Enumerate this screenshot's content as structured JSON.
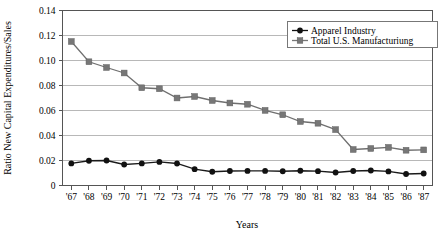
{
  "chart_data": {
    "type": "line",
    "title": "",
    "xlabel": "Years",
    "ylabel": "Ratio New Capital Expenditures/Sales",
    "x": [
      "'67",
      "'68",
      "'69",
      "'70",
      "'71",
      "'72",
      "'73",
      "'74",
      "'75",
      "'76",
      "'77",
      "'78",
      "'79",
      "'80",
      "'81",
      "'82",
      "'83",
      "'84",
      "'85",
      "'86",
      "'87"
    ],
    "categories": [
      "'67",
      "'68",
      "'69",
      "'70",
      "'71",
      "'72",
      "'73",
      "'74",
      "'75",
      "'76",
      "'77",
      "'78",
      "'79",
      "'80",
      "'81",
      "'82",
      "'83",
      "'84",
      "'85",
      "'86",
      "'87"
    ],
    "ylim": [
      0,
      0.14
    ],
    "yticks": [
      0,
      0.02,
      0.04,
      0.06,
      0.08,
      0.1,
      0.12,
      0.14
    ],
    "ytick_labels": [
      "0",
      "0.02",
      "0.04",
      "0.06",
      "0.08",
      "0.10",
      "0.12",
      "0.14"
    ],
    "grid": true,
    "legend_position": "top-right",
    "series": [
      {
        "name": "Apparel Industry",
        "marker": "circle",
        "color": "#111111",
        "values": [
          0.0177,
          0.0198,
          0.02,
          0.0168,
          0.0177,
          0.0189,
          0.0176,
          0.0131,
          0.011,
          0.0116,
          0.0117,
          0.0117,
          0.0114,
          0.0118,
          0.0115,
          0.0104,
          0.0116,
          0.012,
          0.0113,
          0.0092,
          0.0096
        ]
      },
      {
        "name": "Total U.S. Manufacturiung",
        "marker": "square",
        "color": "#777777",
        "values": [
          0.1152,
          0.099,
          0.0944,
          0.09,
          0.0782,
          0.0774,
          0.07,
          0.0712,
          0.068,
          0.066,
          0.065,
          0.0601,
          0.0566,
          0.0512,
          0.0498,
          0.0447,
          0.0288,
          0.0296,
          0.0305,
          0.0282,
          0.0285
        ]
      }
    ]
  },
  "legend": {
    "entries": [
      {
        "label": "Apparel Industry"
      },
      {
        "label": "Total U.S. Manufacturiung"
      }
    ]
  }
}
